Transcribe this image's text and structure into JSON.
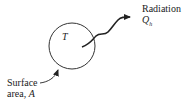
{
  "diagram": {
    "body_label": "T",
    "radiation_label": "Radiation",
    "heat_flux_symbol": "Q",
    "heat_flux_subscript": "h",
    "surface_label_line1": "Surface",
    "surface_label_line2": "area, ",
    "surface_symbol": "A"
  }
}
